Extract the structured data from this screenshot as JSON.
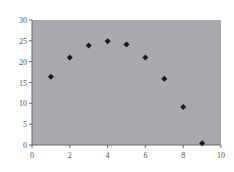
{
  "chart_data": {
    "type": "scatter",
    "title": "",
    "xlabel": "",
    "ylabel": "",
    "xlim": [
      0,
      10
    ],
    "ylim": [
      0,
      30
    ],
    "x_ticks": [
      "0",
      "2",
      "4",
      "6",
      "8",
      "10"
    ],
    "y_ticks": [
      "0",
      "5",
      "10",
      "15",
      "20",
      "25",
      "30"
    ],
    "grid": false,
    "legend": null,
    "series": [
      {
        "name": "",
        "marker": "diamond",
        "x": [
          1,
          2,
          3,
          4,
          5,
          6,
          7,
          8,
          9
        ],
        "y": [
          16.4,
          21.0,
          23.9,
          24.9,
          24.1,
          21.0,
          15.9,
          9.1,
          0.4
        ]
      }
    ]
  },
  "colors": {
    "plot_background": "#a9a8ad",
    "marker": "#1a1a1a",
    "axis": "#666666"
  }
}
